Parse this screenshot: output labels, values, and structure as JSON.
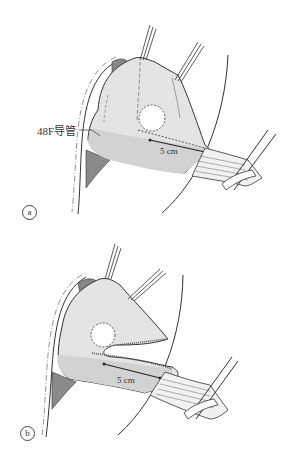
{
  "figure": {
    "panels": [
      {
        "id": "a",
        "label": "a",
        "annotations": {
          "bougie_label": "48F导管",
          "distance_label": "5 cm"
        }
      },
      {
        "id": "b",
        "label": "b",
        "annotations": {
          "distance_label": "5 cm"
        }
      }
    ],
    "colors": {
      "stomach_fill": "#e6e6e6",
      "stomach_shade": "#cfcfcf",
      "outline": "#3a3a3a",
      "dark_shadow": "#8a8a8a",
      "background": "#ffffff"
    }
  }
}
